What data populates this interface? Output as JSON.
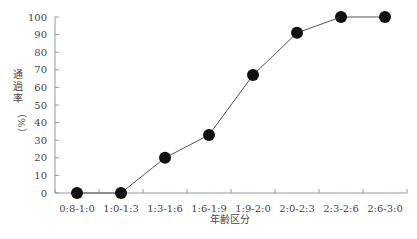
{
  "chart_data": {
    "type": "line",
    "title": "",
    "xlabel": "年齢区分",
    "ylabel": "通過率（%）",
    "ylabel_main": "通過率",
    "ylabel_unit": "（%）",
    "categories": [
      "0:8-1:0",
      "1:0-1:3",
      "1:3-1:6",
      "1:6-1:9",
      "1:9-2:0",
      "2:0-2:3",
      "2:3-2:6",
      "2:6-3:0"
    ],
    "series": [
      {
        "name": "通過率",
        "values": [
          0,
          0,
          20,
          33,
          67,
          91,
          100,
          100
        ]
      }
    ],
    "yticks": [
      "0",
      "10",
      "20",
      "30",
      "40",
      "50",
      "60",
      "70",
      "80",
      "90",
      "100"
    ],
    "ylim": [
      0,
      100
    ],
    "grid": false,
    "legend": "none",
    "marker": "filled-circle",
    "colors": {
      "line": "#555555",
      "marker": "#111111",
      "axis": "#999999"
    }
  }
}
